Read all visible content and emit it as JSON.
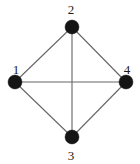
{
  "figure": {
    "kind": "undirected-graph-diagram",
    "width": 140,
    "height": 164,
    "background_color": "#ffffff",
    "node_color": "#151515",
    "edge_color": "#666666",
    "label_color": "#1a1a1a"
  },
  "graph": {
    "nodes": [
      {
        "id": "1",
        "label": "1",
        "cx": 15,
        "cy": 82,
        "r": 7,
        "label_x": 16,
        "label_y": 69
      },
      {
        "id": "2",
        "label": "2",
        "cx": 72,
        "cy": 27,
        "r": 7,
        "label_x": 71,
        "label_y": 9
      },
      {
        "id": "3",
        "label": "3",
        "cx": 72,
        "cy": 137,
        "r": 7,
        "label_x": 71,
        "label_y": 155
      },
      {
        "id": "4",
        "label": "4",
        "cx": 126,
        "cy": 82,
        "r": 7,
        "label_x": 127,
        "label_y": 69
      }
    ],
    "edges": [
      {
        "id": "edge-1-2",
        "from": "1",
        "to": "2",
        "x1": 15,
        "y1": 82,
        "x2": 72,
        "y2": 27
      },
      {
        "id": "edge-2-4",
        "from": "2",
        "to": "4",
        "x1": 72,
        "y1": 27,
        "x2": 126,
        "y2": 82
      },
      {
        "id": "edge-1-3",
        "from": "1",
        "to": "3",
        "x1": 15,
        "y1": 82,
        "x2": 72,
        "y2": 137
      },
      {
        "id": "edge-3-4",
        "from": "3",
        "to": "4",
        "x1": 72,
        "y1": 137,
        "x2": 126,
        "y2": 82
      },
      {
        "id": "edge-2-3",
        "from": "2",
        "to": "3",
        "x1": 72,
        "y1": 27,
        "x2": 72,
        "y2": 137
      },
      {
        "id": "edge-1-4",
        "from": "1",
        "to": "4",
        "x1": 15,
        "y1": 82,
        "x2": 126,
        "y2": 82
      }
    ]
  }
}
